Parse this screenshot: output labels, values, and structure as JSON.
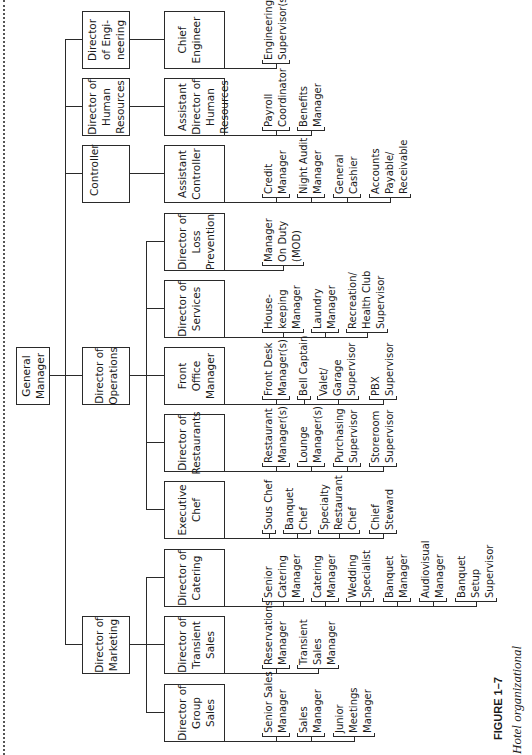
{
  "chart": {
    "general_manager": {
      "label": "General\nManager"
    },
    "directors": [
      {
        "id": "engineering",
        "label": "Director\nof Engi-\nneering",
        "u": 686,
        "sub": [
          {
            "label": "Chief\nEngineer",
            "u": 686,
            "groups": [
              {
                "lines": [
                  "Engineering",
                  "Supervisor(s)"
                ],
                "v": 262
              }
            ]
          }
        ]
      },
      {
        "id": "hr",
        "label": "Director of\nHuman\nResources",
        "u": 619,
        "sub": [
          {
            "label": "Assistant\nDirector of\nHuman\nResources",
            "u": 619,
            "groups": [
              {
                "lines": [
                  "Payroll",
                  "Coordinator"
                ],
                "v": 262
              },
              {
                "lines": [
                  "Benefits",
                  "Manager"
                ],
                "v": 297
              }
            ]
          }
        ]
      },
      {
        "id": "controller",
        "label": "Controller",
        "u": 552,
        "align": "top",
        "sub": [
          {
            "label": "Assistant\nController",
            "u": 552,
            "groups": [
              {
                "lines": [
                  "Credit",
                  "Manager"
                ],
                "v": 262
              },
              {
                "lines": [
                  "Night Audit",
                  "Manager"
                ],
                "v": 297
              },
              {
                "lines": [
                  "General",
                  "Cashier"
                ],
                "v": 333
              },
              {
                "lines": [
                  "Accounts",
                  "Payable/",
                  "Receivable"
                ],
                "v": 369
              }
            ]
          }
        ]
      },
      {
        "id": "operations",
        "label": "Director of\nOperations",
        "u": 350,
        "sub": [
          {
            "label": "Director of\nLoss\nPrevention",
            "u": 484,
            "groups": [
              {
                "lines": [
                  "Manager",
                  "On Duty",
                  "(MOD)"
                ],
                "v": 262
              }
            ]
          },
          {
            "label": "Director of\nServices",
            "u": 417,
            "groups": [
              {
                "lines": [
                  "House-",
                  "keeping",
                  "Manager"
                ],
                "v": 262
              },
              {
                "lines": [
                  "Laundry",
                  "Manager"
                ],
                "v": 311
              },
              {
                "lines": [
                  "Recreation/",
                  "Health Club",
                  "Supervisor"
                ],
                "v": 346
              }
            ]
          },
          {
            "label": "Front\nOffice\nManager",
            "u": 350,
            "groups": [
              {
                "lines": [
                  "Front Desk",
                  "Manager(s)"
                ],
                "v": 262
              },
              {
                "lines": [
                  "Bell Captain"
                ],
                "v": 297
              },
              {
                "lines": [
                  "Valet/",
                  "Garage",
                  "Supervisor"
                ],
                "v": 317
              },
              {
                "lines": [
                  "PBX",
                  "Supervisor"
                ],
                "v": 369
              }
            ]
          },
          {
            "label": "Director of\nRestaurants",
            "u": 283,
            "groups": [
              {
                "lines": [
                  "Restaurant",
                  "Manager(s)"
                ],
                "v": 262
              },
              {
                "lines": [
                  "Lounge",
                  "Manager(s)"
                ],
                "v": 297
              },
              {
                "lines": [
                  "Purchasing",
                  "Supervisor"
                ],
                "v": 333
              },
              {
                "lines": [
                  "Storeroom",
                  "Supervisor"
                ],
                "v": 369
              }
            ]
          },
          {
            "label": "Executive\nChef",
            "u": 216,
            "groups": [
              {
                "lines": [
                  "Sous Chef"
                ],
                "v": 262
              },
              {
                "lines": [
                  "Banquet",
                  "Chef"
                ],
                "v": 283
              },
              {
                "lines": [
                  "Specialty",
                  "Restaurant",
                  "Chef"
                ],
                "v": 318
              },
              {
                "lines": [
                  "Chief",
                  "Steward"
                ],
                "v": 369
              }
            ]
          }
        ]
      },
      {
        "id": "marketing",
        "label": "Director of\nMarketing",
        "u": 81,
        "sub": [
          {
            "label": "Director of\nCatering",
            "u": 148,
            "groups": [
              {
                "lines": [
                  "Senior",
                  "Catering",
                  "Manager"
                ],
                "v": 262
              },
              {
                "lines": [
                  "Catering",
                  "Manager"
                ],
                "v": 311
              },
              {
                "lines": [
                  "Wedding",
                  "Specialist"
                ],
                "v": 346
              },
              {
                "lines": [
                  "Banquet",
                  "Manager"
                ],
                "v": 383
              },
              {
                "lines": [
                  "Audiovisual",
                  "Manager"
                ],
                "v": 419
              },
              {
                "lines": [
                  "Banquet",
                  "Setup",
                  "Supervisor"
                ],
                "v": 455
              }
            ]
          },
          {
            "label": "Director of\nTransient\nSales",
            "u": 81,
            "groups": [
              {
                "lines": [
                  "Reservations",
                  "Manager"
                ],
                "v": 262
              },
              {
                "lines": [
                  "Transient",
                  "Sales",
                  "Manager"
                ],
                "v": 297
              }
            ]
          },
          {
            "label": "Director of\nGroup\nSales",
            "u": 13,
            "groups": [
              {
                "lines": [
                  "Senior Sales",
                  "Manager"
                ],
                "v": 262
              },
              {
                "lines": [
                  "Sales",
                  "Manager"
                ],
                "v": 297
              },
              {
                "lines": [
                  "Junior",
                  "Meetings",
                  "Manager"
                ],
                "v": 333
              }
            ]
          }
        ]
      }
    ]
  },
  "caption": {
    "figure": "FIGURE 1–7",
    "title": "Hotel organizational"
  }
}
